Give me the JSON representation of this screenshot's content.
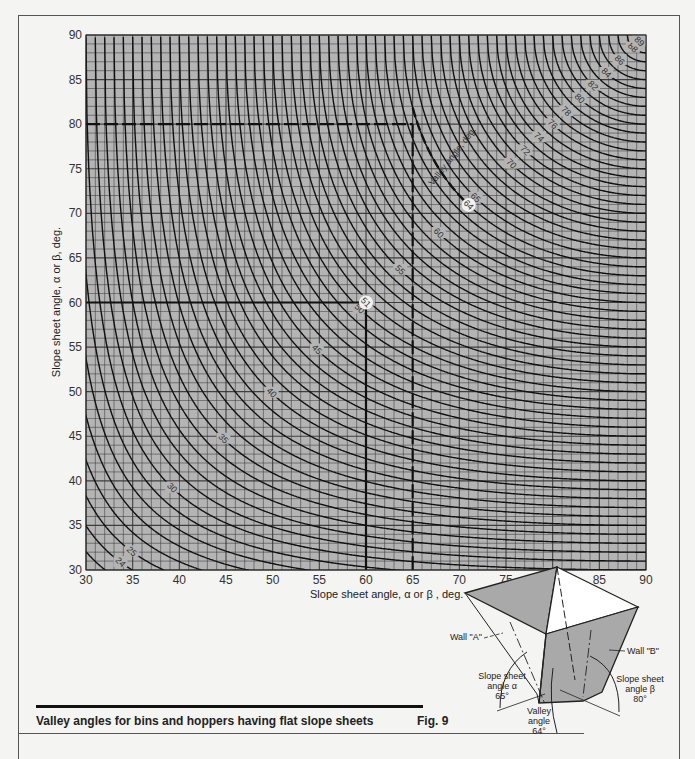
{
  "header": {
    "running_head": "..."
  },
  "caption": {
    "title": "Valley angles for bins and hoppers having flat slope sheets",
    "figure": "Fig. 9"
  },
  "chart_data": {
    "type": "line",
    "title": "Valley angles for bins and hoppers having flat slope sheets",
    "xlabel": "Slope sheet angle, α or β , deg.",
    "ylabel": "Slope sheet angle, α or β, deg.",
    "xlim": [
      30,
      90
    ],
    "ylim": [
      30,
      90
    ],
    "xticks": [
      30,
      35,
      40,
      45,
      50,
      55,
      60,
      65,
      70,
      75,
      80,
      85,
      90
    ],
    "yticks": [
      30,
      35,
      40,
      45,
      50,
      55,
      60,
      65,
      70,
      75,
      80,
      85,
      90
    ],
    "grid": {
      "minor_step": 1,
      "major_step": 5
    },
    "contour_title": "Valley angle, deg.",
    "contours": [
      23,
      24,
      25,
      26,
      27,
      28,
      29,
      30,
      31,
      32,
      33,
      34,
      35,
      36,
      37,
      38,
      39,
      40,
      41,
      42,
      43,
      44,
      45,
      46,
      47,
      48,
      49,
      50,
      51,
      52,
      53,
      54,
      55,
      56,
      57,
      58,
      59,
      60,
      61,
      62,
      63,
      64,
      65,
      66,
      67,
      68,
      69,
      70,
      71,
      72,
      73,
      74,
      75,
      76,
      77,
      78,
      79,
      80,
      81,
      82,
      83,
      84,
      85,
      86,
      87,
      88,
      89
    ],
    "contour_labels": [
      23,
      24,
      25,
      30,
      35,
      40,
      45,
      50,
      51,
      55,
      60,
      64,
      65,
      70,
      72,
      74,
      76,
      78,
      80,
      82,
      84,
      86,
      88,
      89
    ],
    "examples": [
      {
        "alpha": 60,
        "beta": 60,
        "valley": 51,
        "label": "51"
      },
      {
        "alpha": 65,
        "beta": 80,
        "valley": 64,
        "label": "64"
      }
    ]
  },
  "diagram": {
    "wall_a": "Wall \"A\"",
    "wall_b": "Wall \"B\"",
    "alpha_label": [
      "Slope sheet",
      "angle α",
      "65°"
    ],
    "beta_label": [
      "Slope sheet",
      "angle β",
      "80°"
    ],
    "valley_label": [
      "Valley",
      "angle",
      "64°"
    ]
  },
  "colors": {
    "plot_bg": "#b4b4b4",
    "grid": "#333333",
    "curve": "#111111",
    "diagram_fill": "#a9a9a9"
  }
}
